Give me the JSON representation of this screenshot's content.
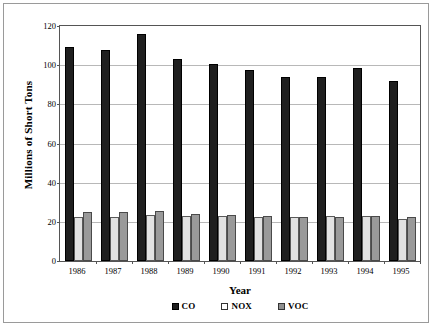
{
  "chart_data": {
    "type": "bar",
    "title": "",
    "xlabel": "Year",
    "ylabel": "Millions of Short Tons",
    "categories": [
      "1986",
      "1987",
      "1988",
      "1989",
      "1990",
      "1991",
      "1992",
      "1993",
      "1994",
      "1995"
    ],
    "ylim": [
      0,
      120
    ],
    "yticks": [
      0,
      20,
      40,
      60,
      80,
      100,
      120
    ],
    "ytick_labels": [
      "0",
      "20",
      "40",
      "60",
      "80",
      "100",
      "120"
    ],
    "grid": true,
    "legend_position": "bottom",
    "series": [
      {
        "name": "CO",
        "color": "#1f1f1f",
        "values": [
          109.5,
          108.0,
          116.0,
          103.0,
          100.5,
          97.5,
          94.0,
          94.0,
          98.5,
          92.0
        ]
      },
      {
        "name": "NOX",
        "color": "#e2e2e2",
        "values": [
          22.5,
          22.3,
          23.5,
          23.0,
          22.8,
          22.5,
          22.6,
          23.2,
          23.2,
          21.5
        ]
      },
      {
        "name": "VOC",
        "color": "#9a9a9a",
        "values": [
          25.0,
          24.8,
          25.5,
          24.0,
          23.5,
          22.8,
          22.3,
          22.3,
          23.0,
          22.5
        ]
      }
    ]
  },
  "axes": {
    "y_title": "Millions of Short Tons",
    "x_title": "Year"
  },
  "legend": {
    "items": [
      {
        "label": "CO",
        "series": "co"
      },
      {
        "label": "NOX",
        "series": "nox"
      },
      {
        "label": "VOC",
        "series": "voc"
      }
    ]
  }
}
